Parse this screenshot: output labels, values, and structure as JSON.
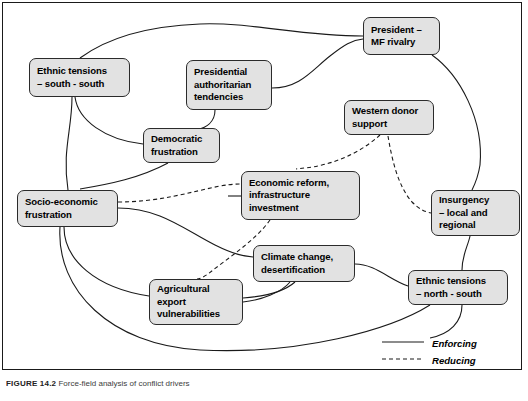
{
  "figure": {
    "caption_label": "FIGURE 14.2",
    "caption_text": "Force-field analysis of conflict drivers"
  },
  "nodes": [
    {
      "id": "ethnic-south",
      "label": "Ethnic tensions\n– south - south"
    },
    {
      "id": "presidential",
      "label": "Presidential\nauthoritarian\ntendencies"
    },
    {
      "id": "president-mf",
      "label": "President –\nMF rivalry"
    },
    {
      "id": "democratic",
      "label": "Democratic\nfrustration"
    },
    {
      "id": "western-donor",
      "label": "Western donor\nsupport"
    },
    {
      "id": "socio-economic",
      "label": "Socio-economic\nfrustration"
    },
    {
      "id": "economic-reform",
      "label": "Economic reform,\ninfrastructure\ninvestment"
    },
    {
      "id": "insurgency",
      "label": "Insurgency\n– local and\nregional"
    },
    {
      "id": "climate-change",
      "label": "Climate change,\ndesertification"
    },
    {
      "id": "agricultural",
      "label": "Agricultural\nexport\nvulnerabilities"
    },
    {
      "id": "ethnic-north",
      "label": "Ethnic tensions\n– north - south"
    }
  ],
  "legend": {
    "enforcing_label": "Enforcing",
    "reducing_label": "Reducing"
  },
  "style": {
    "node_fill": "#e2e2e2",
    "node_stroke": "#2b2b2b",
    "edge_color": "#1a1a1a",
    "frame_color": "#1a1a1a",
    "background": "#ffffff"
  }
}
